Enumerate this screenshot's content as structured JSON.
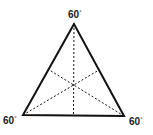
{
  "diagram": {
    "type": "equilateral-triangle",
    "vertices": {
      "top": {
        "x": 74,
        "y": 24
      },
      "bottom_left": {
        "x": 23,
        "y": 115
      },
      "bottom_right": {
        "x": 124,
        "y": 116
      }
    },
    "angle_labels": {
      "top": {
        "value": "60",
        "unit": "°"
      },
      "bottom_left": {
        "value": "60",
        "unit": "°"
      },
      "bottom_right": {
        "value": "60",
        "unit": "°"
      }
    },
    "medians": [
      "top-to-base-midpoint",
      "bottom-left-to-right-side-midpoint",
      "bottom-right-to-left-side-midpoint"
    ],
    "colors": {
      "stroke": "#111111",
      "label": "#222222"
    }
  }
}
